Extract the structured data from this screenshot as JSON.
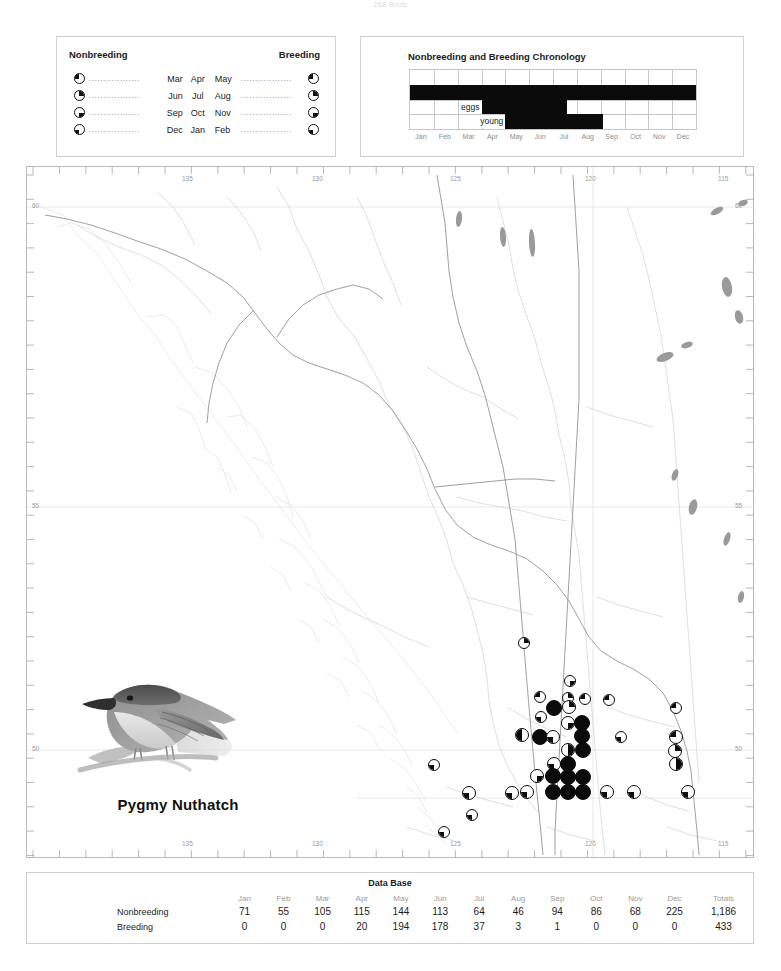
{
  "page": {
    "header_text": "268  Birds",
    "species_name": "Pygmy Nuthatch",
    "bird_icon": "pygmy-nuthatch-illustration"
  },
  "legend": {
    "nonbreeding_title": "Nonbreeding",
    "breeding_title": "Breeding",
    "dots_left": "..................",
    "dots_right": "..................",
    "rows": [
      {
        "symbol": "nw",
        "m1": "Mar",
        "m2": "Apr",
        "m3": "May"
      },
      {
        "symbol": "ne",
        "m1": "Jun",
        "m2": "Jul",
        "m3": "Aug"
      },
      {
        "symbol": "se",
        "m1": "Sep",
        "m2": "Oct",
        "m3": "Nov"
      },
      {
        "symbol": "sw",
        "m1": "Dec",
        "m2": "Jan",
        "m3": "Feb"
      }
    ]
  },
  "chronology": {
    "title": "Nonbreeding and Breeding Chronology",
    "months": [
      "Jan",
      "Feb",
      "Mar",
      "Apr",
      "May",
      "Jun",
      "Jul",
      "Aug",
      "Sep",
      "Oct",
      "Nov",
      "Dec"
    ],
    "eggs_label": "eggs",
    "young_label": "young",
    "bars": [
      {
        "name": "nonbreeding",
        "row": 1,
        "start_month": 0.0,
        "end_month": 12.0
      },
      {
        "name": "eggs",
        "row": 2,
        "start_month": 3.0,
        "end_month": 6.6
      },
      {
        "name": "young",
        "row": 3,
        "start_month": 4.0,
        "end_month": 8.1
      }
    ],
    "bar_color": "#0b0b0b"
  },
  "map": {
    "lon_labels": [
      "135",
      "130",
      "125",
      "120",
      "115"
    ],
    "lat_labels": [
      "60",
      "55",
      "50"
    ],
    "outline_color": "#d6d6d6",
    "border_color": "#9a9a9a",
    "graticule_color": "#cccccc",
    "dots": [
      {
        "x": 524,
        "y": 643,
        "r": 6,
        "fill": "ne"
      },
      {
        "x": 570,
        "y": 681,
        "r": 6,
        "fill": "se"
      },
      {
        "x": 540,
        "y": 697,
        "r": 6,
        "fill": "nw"
      },
      {
        "x": 568,
        "y": 698,
        "r": 6,
        "fill": "ne"
      },
      {
        "x": 585,
        "y": 699,
        "r": 6,
        "fill": "nw"
      },
      {
        "x": 554,
        "y": 708,
        "r": 8,
        "fill": "full"
      },
      {
        "x": 569,
        "y": 707,
        "r": 7,
        "fill": "ne"
      },
      {
        "x": 609,
        "y": 700,
        "r": 6,
        "fill": "nw"
      },
      {
        "x": 676,
        "y": 708,
        "r": 6,
        "fill": "nw"
      },
      {
        "x": 541,
        "y": 717,
        "r": 6,
        "fill": "sw"
      },
      {
        "x": 568,
        "y": 723,
        "r": 7,
        "fill": "se"
      },
      {
        "x": 582,
        "y": 723,
        "r": 8,
        "fill": "full"
      },
      {
        "x": 522,
        "y": 735,
        "r": 7,
        "fill": "half-l"
      },
      {
        "x": 540,
        "y": 737,
        "r": 8,
        "fill": "full"
      },
      {
        "x": 553,
        "y": 737,
        "r": 7,
        "fill": "sw"
      },
      {
        "x": 582,
        "y": 736,
        "r": 8,
        "fill": "full"
      },
      {
        "x": 621,
        "y": 737,
        "r": 6,
        "fill": "sw"
      },
      {
        "x": 676,
        "y": 737,
        "r": 7,
        "fill": "nw"
      },
      {
        "x": 568,
        "y": 750,
        "r": 7,
        "fill": "half-r"
      },
      {
        "x": 583,
        "y": 750,
        "r": 8,
        "fill": "full"
      },
      {
        "x": 675,
        "y": 751,
        "r": 7,
        "fill": "ne"
      },
      {
        "x": 554,
        "y": 764,
        "r": 7,
        "fill": "sw"
      },
      {
        "x": 568,
        "y": 764,
        "r": 8,
        "fill": "full"
      },
      {
        "x": 676,
        "y": 764,
        "r": 7,
        "fill": "half-r"
      },
      {
        "x": 537,
        "y": 776,
        "r": 7,
        "fill": "se"
      },
      {
        "x": 553,
        "y": 776,
        "r": 8,
        "fill": "full"
      },
      {
        "x": 568,
        "y": 777,
        "r": 8,
        "fill": "full"
      },
      {
        "x": 583,
        "y": 777,
        "r": 8,
        "fill": "full"
      },
      {
        "x": 434,
        "y": 765,
        "r": 6,
        "fill": "sw"
      },
      {
        "x": 469,
        "y": 793,
        "r": 7,
        "fill": "sw"
      },
      {
        "x": 472,
        "y": 815,
        "r": 6,
        "fill": "sw"
      },
      {
        "x": 444,
        "y": 832,
        "r": 6,
        "fill": "sw"
      },
      {
        "x": 512,
        "y": 793,
        "r": 7,
        "fill": "sw"
      },
      {
        "x": 527,
        "y": 792,
        "r": 7,
        "fill": "sw"
      },
      {
        "x": 553,
        "y": 792,
        "r": 8,
        "fill": "full"
      },
      {
        "x": 568,
        "y": 792,
        "r": 8,
        "fill": "full"
      },
      {
        "x": 583,
        "y": 792,
        "r": 8,
        "fill": "full"
      },
      {
        "x": 607,
        "y": 792,
        "r": 7,
        "fill": "sw"
      },
      {
        "x": 634,
        "y": 792,
        "r": 7,
        "fill": "sw"
      },
      {
        "x": 688,
        "y": 792,
        "r": 7,
        "fill": "sw"
      }
    ]
  },
  "database": {
    "title": "Data Base",
    "columns": [
      "Jan",
      "Feb",
      "Mar",
      "Apr",
      "May",
      "Jun",
      "Jul",
      "Aug",
      "Sep",
      "Oct",
      "Nov",
      "Dec"
    ],
    "totals_header": "Totals",
    "rows": [
      {
        "label": "Nonbreeding",
        "values": [
          "71",
          "55",
          "105",
          "115",
          "144",
          "113",
          "64",
          "46",
          "94",
          "86",
          "68",
          "225"
        ],
        "total": "1,186"
      },
      {
        "label": "Breeding",
        "values": [
          "0",
          "0",
          "0",
          "20",
          "194",
          "178",
          "37",
          "3",
          "1",
          "0",
          "0",
          "0"
        ],
        "total": "433"
      }
    ]
  },
  "chart_data": {
    "type": "table",
    "title": "Data Base",
    "categories": [
      "Jan",
      "Feb",
      "Mar",
      "Apr",
      "May",
      "Jun",
      "Jul",
      "Aug",
      "Sep",
      "Oct",
      "Nov",
      "Dec"
    ],
    "series": [
      {
        "name": "Nonbreeding",
        "values": [
          71,
          55,
          105,
          115,
          144,
          113,
          64,
          46,
          94,
          86,
          68,
          225
        ],
        "total": 1186
      },
      {
        "name": "Breeding",
        "values": [
          0,
          0,
          0,
          20,
          194,
          178,
          37,
          3,
          1,
          0,
          0,
          0
        ],
        "total": 433
      }
    ],
    "xlabel": "Month",
    "ylabel": "Records"
  }
}
